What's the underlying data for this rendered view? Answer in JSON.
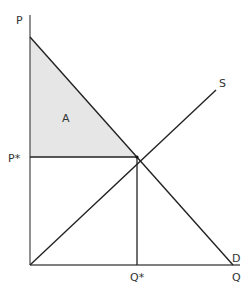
{
  "diagram": {
    "colors": {
      "axis": "#555555",
      "line": "#222222",
      "shade": "#e6e6e6",
      "text": "#333333"
    },
    "axes": {
      "y_label": "P",
      "x_label": "Q"
    },
    "curves": {
      "supply_label": "S",
      "demand_label": "D"
    },
    "equilibrium": {
      "price_label": "P*",
      "quantity_label": "Q*"
    },
    "regions": {
      "consumer_surplus_label": "A"
    }
  }
}
